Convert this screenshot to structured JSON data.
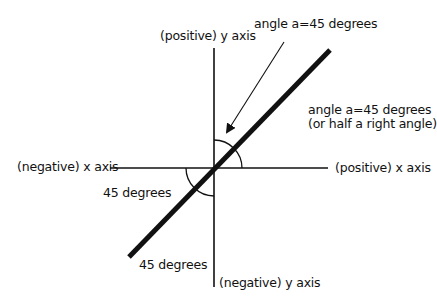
{
  "labels": {
    "positive_y": "(positive) y axis",
    "negative_y": "(negative) y axis",
    "positive_x": "(positive) x axis",
    "negative_x": "(negative) x axis",
    "angle_pointer": "angle a=45 degrees",
    "angle_right_line1": "angle a=45 degrees",
    "angle_right_line2": "(or half a right angle)",
    "angle_lower_left_1": "45 degrees",
    "angle_lower_left_2": "45 degrees"
  },
  "geometry": {
    "origin": [
      214,
      168
    ],
    "x_axis": {
      "from": [
        110,
        168
      ],
      "to": [
        328,
        168
      ]
    },
    "y_axis": {
      "from": [
        214,
        48
      ],
      "to": [
        214,
        287
      ]
    },
    "diagonal_line": {
      "from": [
        129,
        257
      ],
      "to": [
        330,
        50
      ],
      "slope_degrees": 45
    },
    "arrow": {
      "from": [
        284,
        42
      ],
      "to": [
        226,
        133
      ]
    }
  },
  "colors": {
    "line": "#111111",
    "background": "#ffffff"
  }
}
